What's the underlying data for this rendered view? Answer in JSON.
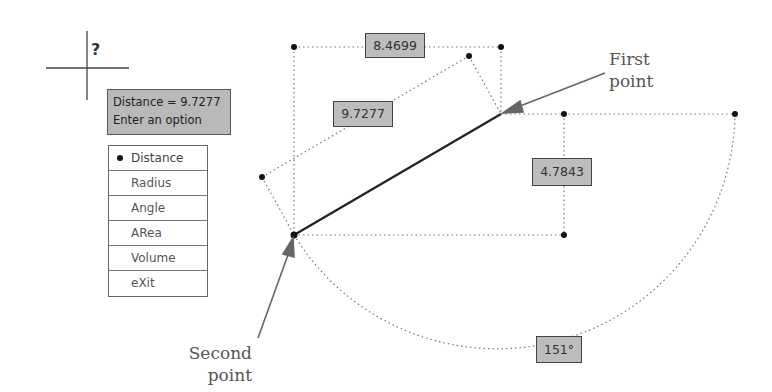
{
  "tooltip": {
    "line1": "Distance = 9.7277",
    "line2": "Enter an option"
  },
  "menu": {
    "items": [
      {
        "label": "Distance",
        "selected": true
      },
      {
        "label": "Radius",
        "selected": false
      },
      {
        "label": "Angle",
        "selected": false
      },
      {
        "label": "ARea",
        "selected": false
      },
      {
        "label": "Volume",
        "selected": false
      },
      {
        "label": "eXit",
        "selected": false
      }
    ]
  },
  "dimensions": {
    "delta_x": "8.4699",
    "distance": "9.7277",
    "delta_y": "4.7843",
    "angle": "151°"
  },
  "callouts": {
    "first_point_line1": "First",
    "first_point_line2": "point",
    "second_point_line1": "Second",
    "second_point_line2": "point"
  },
  "cursor": {
    "icon": "question-mark-icon",
    "glyph": "?"
  },
  "colors": {
    "dimension_box_fill": "#bdbdbd",
    "tooltip_fill": "#b9b9b9",
    "measured_line": "#222222",
    "arrow": "#666666"
  }
}
